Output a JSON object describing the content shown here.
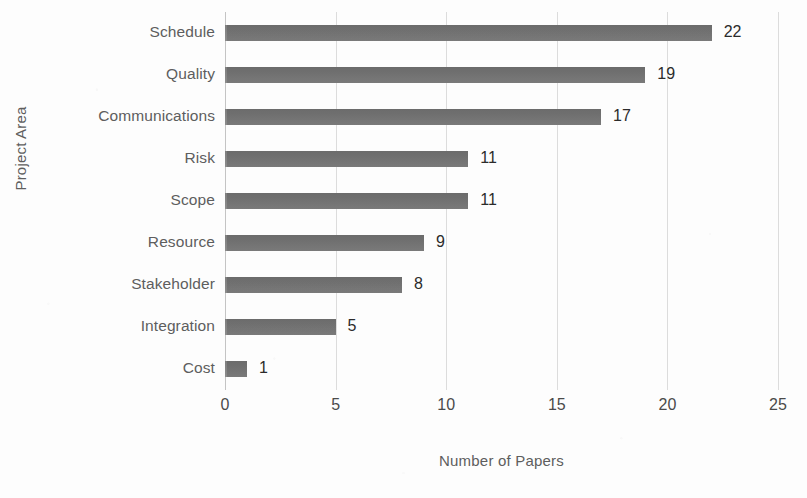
{
  "chart_data": {
    "type": "bar",
    "orientation": "horizontal",
    "title": "",
    "xlabel": "Number of Papers",
    "ylabel": "Project Area",
    "categories": [
      "Schedule",
      "Quality",
      "Communications",
      "Risk",
      "Scope",
      "Resource",
      "Stakeholder",
      "Integration",
      "Cost"
    ],
    "values": [
      22,
      19,
      17,
      11,
      11,
      9,
      8,
      5,
      1
    ],
    "value_labels": [
      "22",
      "19",
      "17",
      "11",
      "11",
      "9",
      "8",
      "5",
      "1"
    ],
    "xlim": [
      0,
      25
    ],
    "xticks": [
      0,
      5,
      10,
      15,
      20,
      25
    ],
    "xtick_labels": [
      "0",
      "5",
      "10",
      "15",
      "20",
      "25"
    ],
    "grid": "vertical",
    "legend": "none",
    "series": [
      {
        "name": "Number of Papers",
        "values": [
          22,
          19,
          17,
          11,
          11,
          9,
          8,
          5,
          1
        ]
      }
    ]
  },
  "style": {
    "bar_color": "#757575",
    "gridline_color": "#dcdcdc",
    "axis_color": "#c4c4c4",
    "category_label_color": "#5e5e5e",
    "value_label_color": "#2b2b2b",
    "tick_label_color": "#4a4a4a",
    "background_color": "#fdfdfd"
  }
}
